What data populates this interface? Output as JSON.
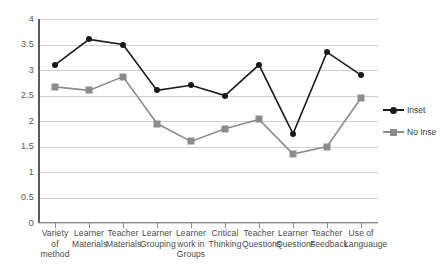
{
  "chart_data": {
    "type": "line",
    "title": "",
    "xlabel": "",
    "ylabel": "",
    "ylim": [
      0,
      4
    ],
    "yticks": [
      "4",
      "3.5",
      "3",
      "2.5",
      "2",
      "1.5",
      "1",
      "0.5",
      "0"
    ],
    "grid": true,
    "legend_position": "right",
    "categories": [
      "Variety of method",
      "Learner Materials",
      "Teacher Materials",
      "Learner Grouping",
      "Learner work in Groups",
      "Critical Thinking",
      "Teacher Questions",
      "Learner Questions",
      "Teacher Feedback",
      "Use of Languauge"
    ],
    "series": [
      {
        "name": "Inset",
        "color": "#1a1a1a",
        "marker": "circle",
        "values": [
          3.1,
          3.6,
          3.5,
          2.6,
          2.7,
          2.5,
          3.1,
          1.75,
          3.35,
          2.9
        ]
      },
      {
        "name": "No Inse",
        "color": "#8c8c8c",
        "marker": "square",
        "values": [
          2.67,
          2.6,
          2.87,
          1.95,
          1.6,
          1.85,
          2.03,
          1.35,
          1.5,
          2.45
        ]
      }
    ]
  },
  "legend": {
    "entries": [
      {
        "label": "Inset"
      },
      {
        "label": "No Inse"
      }
    ]
  }
}
